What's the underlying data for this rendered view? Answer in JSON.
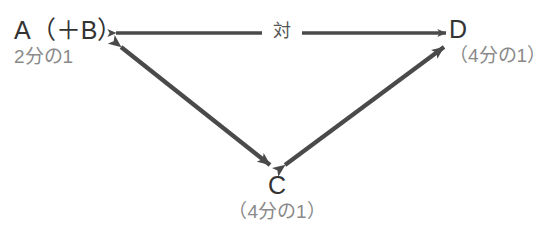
{
  "diagram": {
    "type": "relationship-triangle",
    "background_color": "#ffffff",
    "line_color": "#4a4a4a",
    "label_color": "#333333",
    "sublabel_color": "#8a8a8a",
    "nodes": [
      {
        "id": "a",
        "label": "A（＋B）",
        "sublabel": "2分の1",
        "position": "top-left"
      },
      {
        "id": "d",
        "label": "D",
        "sublabel": "（4分の1）",
        "position": "top-right"
      },
      {
        "id": "c",
        "label": "C",
        "sublabel": "（4分の1）",
        "position": "bottom-center"
      }
    ],
    "edges": [
      {
        "id": "a-d",
        "from": "a",
        "to": "d",
        "arrowheads": "both",
        "label": "対"
      },
      {
        "id": "a-c",
        "from": "a",
        "to": "c",
        "arrowheads": "both",
        "label": ""
      },
      {
        "id": "c-d",
        "from": "c",
        "to": "d",
        "arrowheads": "both",
        "label": ""
      }
    ]
  }
}
